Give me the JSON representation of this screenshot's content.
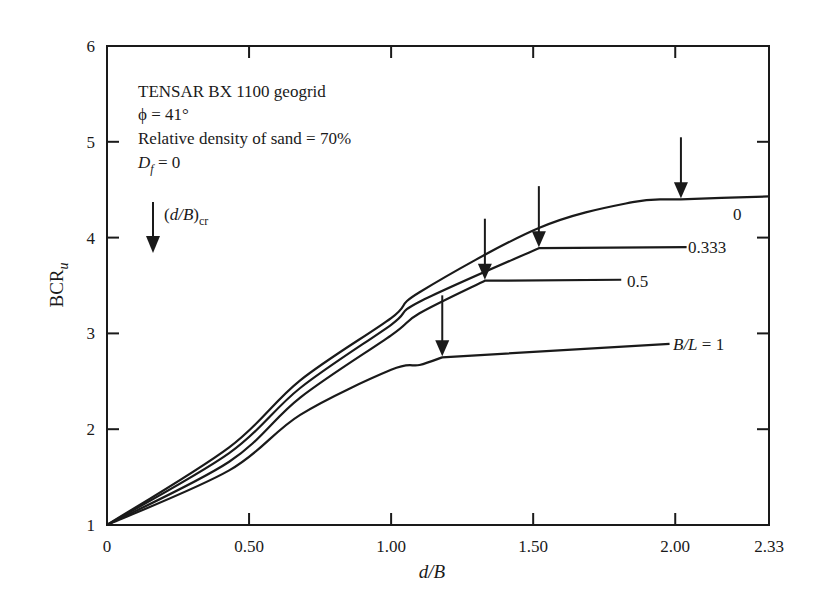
{
  "chart_data": {
    "type": "line",
    "title": "",
    "xlabel": "d/B",
    "ylabel": "BCR_u",
    "xlim": [
      0,
      2.33
    ],
    "ylim": [
      1,
      6
    ],
    "x_ticks": [
      {
        "value": 0,
        "label": "0"
      },
      {
        "value": 0.5,
        "label": "0.50"
      },
      {
        "value": 1.0,
        "label": "1.00"
      },
      {
        "value": 1.5,
        "label": "1.50"
      },
      {
        "value": 2.0,
        "label": "2.00"
      },
      {
        "value": 2.33,
        "label": "2.33"
      }
    ],
    "y_ticks": [
      {
        "value": 1,
        "label": "1"
      },
      {
        "value": 2,
        "label": "2"
      },
      {
        "value": 3,
        "label": "3"
      },
      {
        "value": 4,
        "label": "4"
      },
      {
        "value": 5,
        "label": "5"
      },
      {
        "value": 6,
        "label": "6"
      }
    ],
    "grid": false,
    "annotation_lines": [
      "TENSAR BX 1100 geogrid",
      "ϕ = 41°",
      "Relative density of sand = 70%",
      "D_f = 0"
    ],
    "legend": {
      "symbol": "down-arrow",
      "label": "(d/B)_cr"
    },
    "series": [
      {
        "name": "B/L = 0",
        "label": "0",
        "x": [
          0,
          0.43,
          0.68,
          1.0,
          1.1,
          1.52,
          1.85,
          2.02,
          2.33
        ],
        "y": [
          1,
          1.81,
          2.51,
          3.16,
          3.43,
          4.1,
          4.37,
          4.4,
          4.43
        ],
        "critical_d_over_b": 2.02
      },
      {
        "name": "B/L = 0.333",
        "label": "0.333",
        "x": [
          0,
          0.43,
          0.68,
          1.0,
          1.1,
          1.52,
          2.04
        ],
        "y": [
          1,
          1.75,
          2.43,
          3.09,
          3.33,
          3.89,
          3.9
        ],
        "critical_d_over_b": 1.52
      },
      {
        "name": "B/L = 0.5",
        "label": "0.5",
        "x": [
          0,
          0.43,
          0.68,
          1.0,
          1.1,
          1.33,
          1.81
        ],
        "y": [
          1,
          1.66,
          2.33,
          2.98,
          3.21,
          3.55,
          3.56
        ],
        "critical_d_over_b": 1.33
      },
      {
        "name": "B/L = 1",
        "label": "B/L = 1",
        "x": [
          0,
          0.43,
          0.68,
          1.0,
          1.1,
          1.18,
          1.98
        ],
        "y": [
          1,
          1.57,
          2.15,
          2.62,
          2.67,
          2.75,
          2.89
        ],
        "critical_d_over_b": 1.18
      }
    ]
  }
}
